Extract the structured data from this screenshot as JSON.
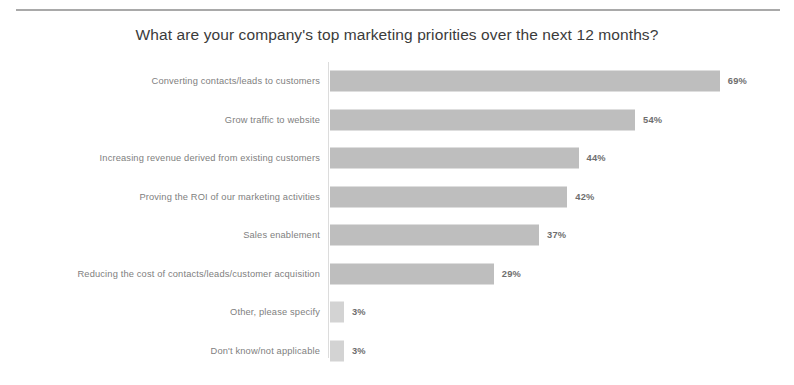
{
  "chart": {
    "title": "What are your company's top marketing priorities over the next 12 months?",
    "top_rule": "horizontal-rule",
    "bar_color": "#b9b9b9",
    "small_bar_color": "#cfcfcf",
    "label_color": "#808080",
    "value_color": "#6e6e6e",
    "title_color": "#3b3b3b"
  },
  "chart_data": {
    "type": "bar",
    "orientation": "horizontal",
    "title": "What are your company's top marketing priorities over the next 12 months?",
    "xlabel": "",
    "ylabel": "",
    "xlim": [
      0,
      75
    ],
    "grid": false,
    "legend": false,
    "value_suffix": "%",
    "categories": [
      "Converting contacts/leads to customers",
      "Grow traffic to website",
      "Increasing revenue derived from existing customers",
      "Proving the ROI of our marketing activities",
      "Sales enablement",
      "Reducing the cost of contacts/leads/customer acquisition",
      "Other, please specify",
      "Don't know/not applicable"
    ],
    "values": [
      69,
      54,
      44,
      42,
      37,
      29,
      3,
      3
    ],
    "value_labels": [
      "69%",
      "54%",
      "44%",
      "42%",
      "37%",
      "29%",
      "3%",
      "3%"
    ]
  }
}
